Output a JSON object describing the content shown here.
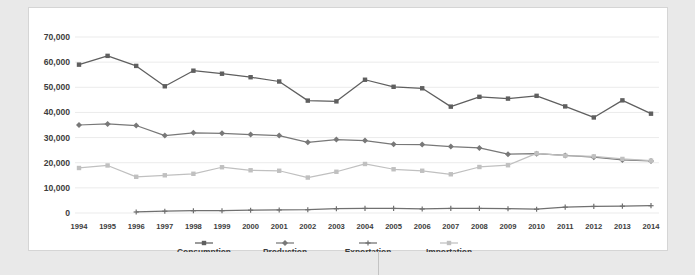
{
  "chart_data": {
    "type": "line",
    "title": "",
    "subtitle": "",
    "xlabel": "",
    "ylabel": "",
    "grid": true,
    "legend_position": "bottom",
    "ylim": [
      0,
      70000
    ],
    "ytick_step": 10000,
    "ytick_labels": [
      "0",
      "10,000",
      "20,000",
      "30,000",
      "40,000",
      "50,000",
      "60,000",
      "70,000"
    ],
    "ytick_values": [
      0,
      10000,
      20000,
      30000,
      40000,
      50000,
      60000,
      70000
    ],
    "categories": [
      "1994",
      "1995",
      "1996",
      "1997",
      "1998",
      "1999",
      "2000",
      "2001",
      "2002",
      "2003",
      "2004",
      "2005",
      "2006",
      "2007",
      "2008",
      "2009",
      "2010",
      "2011",
      "2012",
      "2013",
      "2014"
    ],
    "x": [
      1994,
      1995,
      1996,
      1997,
      1998,
      1999,
      2000,
      2001,
      2002,
      2003,
      2004,
      2005,
      2006,
      2007,
      2008,
      2009,
      2010,
      2011,
      2012,
      2013,
      2014
    ],
    "series": [
      {
        "name": "Consumption",
        "color": "#5f5f5f",
        "marker": "square",
        "values": [
          59000,
          62500,
          58500,
          50400,
          56600,
          55400,
          54000,
          52300,
          44700,
          44400,
          53000,
          50200,
          49600,
          42300,
          46200,
          45500,
          46600,
          42400,
          38000,
          44800,
          39500
        ]
      },
      {
        "name": "Production",
        "color": "#787878",
        "marker": "diamond",
        "values": [
          35000,
          35400,
          34800,
          30800,
          31900,
          31700,
          31200,
          30800,
          28100,
          29200,
          28800,
          27300,
          27200,
          26400,
          25900,
          23400,
          23600,
          22900,
          22200,
          21100,
          20700
        ]
      },
      {
        "name": "Exportation",
        "color": "#707070",
        "marker": "cross",
        "values": [
          null,
          null,
          400,
          700,
          900,
          900,
          1100,
          1200,
          1300,
          1700,
          1800,
          1800,
          1600,
          1800,
          1800,
          1700,
          1500,
          2300,
          2600,
          2700,
          2900
        ]
      },
      {
        "name": "Importation",
        "color": "#c0c0c0",
        "marker": "square",
        "values": [
          17900,
          18900,
          14400,
          15000,
          15600,
          18200,
          17000,
          16800,
          14100,
          16400,
          19500,
          17400,
          16800,
          15400,
          18300,
          19000,
          23700,
          22800,
          22500,
          21500,
          20800
        ]
      }
    ]
  },
  "legend": {
    "items": [
      {
        "label": "Consumption"
      },
      {
        "label": "Production"
      },
      {
        "label": "Exportation"
      },
      {
        "label": "Importation"
      }
    ]
  }
}
